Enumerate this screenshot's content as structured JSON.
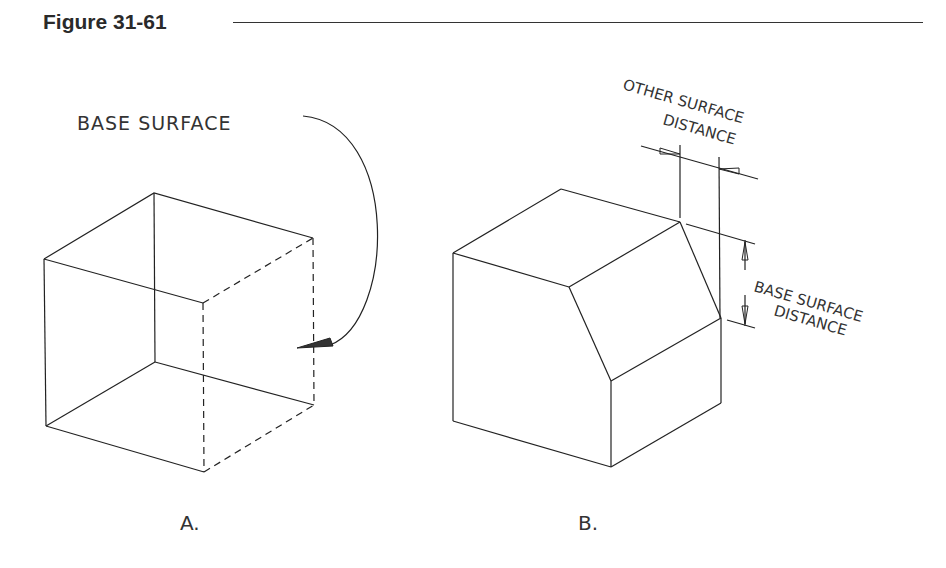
{
  "figure": {
    "title": "Figure 31-61"
  },
  "panel_a": {
    "label": "A.",
    "callout": "BASE SURFACE",
    "description": "Cube with hidden (dashed) edges; curved leader arrow pointing to right face as base surface"
  },
  "panel_b": {
    "label": "B.",
    "dim_other_line1": "OTHER SURFACE",
    "dim_other_line2": "DISTANCE",
    "dim_base_line1": "BASE SURFACE",
    "dim_base_line2": "DISTANCE",
    "description": "Chamfered cube with dimension lines for other surface distance and base surface distance"
  },
  "colors": {
    "line": "#222222",
    "text": "#333333",
    "background": "#ffffff"
  }
}
